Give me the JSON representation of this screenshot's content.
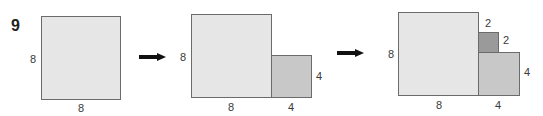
{
  "problem_number": "9",
  "colors": {
    "large_fill": "#e6e6e6",
    "medium_fill": "#c8c8c8",
    "small_fill": "#9a9a9a",
    "border": "#6b6b6b",
    "arrow": "#111111"
  },
  "panels": [
    {
      "squares": [
        {
          "role": "large",
          "side": 8
        }
      ],
      "labels": {
        "left": "8",
        "bottom": "8"
      }
    },
    {
      "squares": [
        {
          "role": "large",
          "side": 8
        },
        {
          "role": "medium",
          "side": 4
        }
      ],
      "labels": {
        "left": "8",
        "bottom_large": "8",
        "bottom_medium": "4",
        "right_medium": "4"
      }
    },
    {
      "squares": [
        {
          "role": "large",
          "side": 8
        },
        {
          "role": "medium",
          "side": 4
        },
        {
          "role": "small",
          "side": 2
        }
      ],
      "labels": {
        "left": "8",
        "bottom_large": "8",
        "bottom_medium": "4",
        "right_medium": "4",
        "top_small": "2",
        "right_small": "2"
      }
    }
  ]
}
